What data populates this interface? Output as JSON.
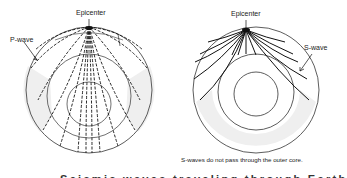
{
  "left_diagram": {
    "epicenter_label": "Epicenter",
    "wave_label": "P-wave"
  },
  "right_diagram": {
    "epicenter_label": "Epicenter",
    "wave_label": "S-wave",
    "note": "S-waves do not pass through the outer core."
  },
  "caption": "Seismic waves traveling through Earth"
}
